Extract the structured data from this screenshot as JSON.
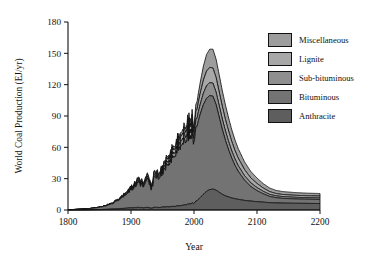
{
  "chart_data": {
    "type": "area",
    "stacked": true,
    "title": "",
    "xlabel": "Year",
    "ylabel": "World Coal Production (EJ/yr)",
    "xlim": [
      1800,
      2200
    ],
    "ylim": [
      0,
      180
    ],
    "xticks": [
      1800,
      1900,
      2000,
      2100,
      2200
    ],
    "yticks": [
      0,
      30,
      60,
      90,
      120,
      150,
      180
    ],
    "grid": false,
    "legend_position": "right-top",
    "series_order_bottom_to_top": [
      "Anthracite",
      "Bituminous",
      "Sub-bituminous",
      "Lignite",
      "Miscellaneous"
    ],
    "x": [
      1800,
      1810,
      1820,
      1830,
      1840,
      1850,
      1860,
      1870,
      1880,
      1890,
      1900,
      1905,
      1910,
      1913,
      1918,
      1920,
      1925,
      1930,
      1932,
      1937,
      1940,
      1945,
      1950,
      1955,
      1960,
      1965,
      1970,
      1975,
      1980,
      1985,
      1990,
      1995,
      2000,
      2005,
      2010,
      2015,
      2020,
      2025,
      2030,
      2035,
      2040,
      2045,
      2050,
      2055,
      2060,
      2065,
      2070,
      2080,
      2090,
      2100,
      2110,
      2120,
      2130,
      2140,
      2160,
      2180,
      2200
    ],
    "series": [
      {
        "name": "Anthracite",
        "color": "#5e5e5e",
        "values": [
          0.1,
          0.1,
          0.2,
          0.2,
          0.3,
          0.4,
          0.6,
          0.9,
          1.2,
          1.6,
          2.0,
          2.2,
          2.4,
          2.6,
          2.4,
          2.3,
          2.5,
          2.4,
          2.0,
          2.5,
          2.6,
          2.4,
          2.7,
          3.0,
          3.2,
          3.4,
          3.6,
          3.9,
          4.4,
          5.0,
          5.6,
          6.2,
          7.0,
          9.0,
          12.0,
          15.0,
          18.0,
          19.5,
          20.0,
          19.0,
          17.0,
          15.0,
          13.5,
          12.5,
          11.5,
          10.8,
          10.2,
          9.2,
          8.5,
          8.0,
          7.5,
          7.0,
          6.8,
          6.6,
          6.4,
          6.3,
          6.2
        ]
      },
      {
        "name": "Bituminous",
        "color": "#737373",
        "values": [
          0.3,
          0.4,
          0.6,
          0.9,
          1.4,
          2.2,
          3.4,
          5.2,
          8.0,
          12.0,
          17.0,
          20.0,
          23.0,
          26.0,
          23.0,
          24.0,
          27.0,
          27.0,
          22.0,
          29.0,
          30.0,
          28.0,
          33.0,
          38.0,
          43.0,
          46.0,
          50.0,
          54.0,
          59.0,
          63.0,
          66.0,
          66.0,
          64.0,
          72.0,
          80.0,
          86.0,
          89.0,
          90.0,
          89.0,
          82.0,
          72.0,
          62.0,
          53.0,
          45.0,
          38.0,
          32.0,
          27.0,
          19.5,
          14.0,
          10.5,
          8.0,
          6.0,
          5.0,
          4.6,
          4.2,
          4.0,
          3.9
        ]
      },
      {
        "name": "Sub-bituminous",
        "color": "#8f8f8f",
        "values": [
          0.0,
          0.0,
          0.0,
          0.0,
          0.1,
          0.1,
          0.2,
          0.3,
          0.5,
          0.8,
          1.1,
          1.3,
          1.5,
          1.7,
          1.6,
          1.6,
          1.8,
          1.8,
          1.5,
          2.0,
          2.1,
          2.0,
          2.4,
          2.8,
          3.2,
          3.5,
          3.9,
          4.3,
          4.8,
          5.3,
          5.8,
          6.2,
          6.5,
          8.0,
          9.5,
          11.0,
          12.0,
          12.5,
          12.5,
          12.0,
          11.0,
          10.0,
          9.0,
          8.0,
          7.0,
          6.2,
          5.5,
          4.4,
          3.6,
          3.0,
          2.4,
          2.0,
          1.8,
          1.7,
          1.6,
          1.5,
          1.5
        ]
      },
      {
        "name": "Lignite",
        "color": "#a8a8a8",
        "values": [
          0.0,
          0.0,
          0.0,
          0.0,
          0.1,
          0.1,
          0.2,
          0.3,
          0.5,
          0.8,
          1.1,
          1.3,
          1.5,
          1.7,
          1.6,
          1.6,
          1.8,
          1.8,
          1.5,
          2.0,
          2.1,
          2.0,
          2.4,
          2.8,
          3.2,
          3.5,
          3.9,
          4.3,
          4.8,
          5.3,
          5.8,
          6.2,
          6.5,
          8.5,
          10.5,
          12.5,
          14.0,
          14.5,
          14.5,
          14.0,
          13.0,
          12.0,
          11.0,
          10.0,
          9.0,
          8.0,
          7.2,
          5.8,
          4.7,
          3.9,
          3.1,
          2.6,
          2.2,
          2.0,
          1.9,
          1.8,
          1.8
        ]
      },
      {
        "name": "Miscellaneous",
        "color": "#9d9d9d",
        "values": [
          0.0,
          0.0,
          0.0,
          0.0,
          0.0,
          0.1,
          0.1,
          0.2,
          0.3,
          0.5,
          0.7,
          0.8,
          1.0,
          1.1,
          1.0,
          1.0,
          1.2,
          1.2,
          1.0,
          1.3,
          1.4,
          1.3,
          1.6,
          1.9,
          2.2,
          2.4,
          2.7,
          3.0,
          3.4,
          3.8,
          4.2,
          4.5,
          4.8,
          7.5,
          10.5,
          13.5,
          16.0,
          17.5,
          18.0,
          17.5,
          16.5,
          15.0,
          13.8,
          12.5,
          11.3,
          10.2,
          9.2,
          7.5,
          6.2,
          5.2,
          4.2,
          3.5,
          3.0,
          2.8,
          2.6,
          2.5,
          2.4
        ]
      }
    ]
  },
  "axes": {
    "ylabel": "World Coal Production (EJ/yr)",
    "xlabel": "Year",
    "yticks": [
      "0",
      "30",
      "60",
      "90",
      "120",
      "150",
      "180"
    ],
    "xticks": [
      "1800",
      "1900",
      "2000",
      "2100",
      "2200"
    ]
  },
  "legend": {
    "items": [
      {
        "label": "Miscellaneous",
        "color": "#9d9d9d"
      },
      {
        "label": "Lignite",
        "color": "#a8a8a8"
      },
      {
        "label": "Sub-bituminous",
        "color": "#8f8f8f"
      },
      {
        "label": "Bituminous",
        "color": "#737373"
      },
      {
        "label": "Anthracite",
        "color": "#5e5e5e"
      }
    ]
  },
  "colors": {
    "axis": "#111111",
    "outline": "#111111",
    "background": "#ffffff"
  }
}
